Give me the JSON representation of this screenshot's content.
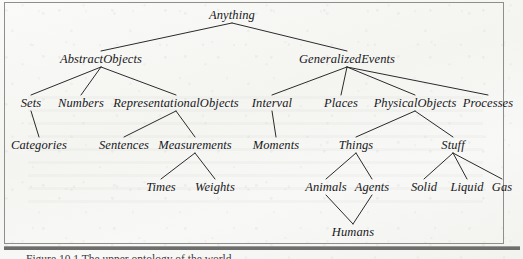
{
  "figure": {
    "caption": "Figure 10.1   The upper ontology of the world.",
    "frame_color": "#8e8e8b",
    "line_color": "#2a2a2c",
    "text_color": "#17171a",
    "paper_color": "#f7f7f5"
  },
  "diagram": {
    "type": "tree",
    "title": "The upper ontology of the world",
    "root": "Anything",
    "nodes": [
      {
        "id": "anything",
        "label": "Anything",
        "level": 1,
        "x": 232,
        "y": 9
      },
      {
        "id": "abstract-objects",
        "label": "AbstractObjects",
        "level": 2,
        "x": 101,
        "y": 53
      },
      {
        "id": "generalized-events",
        "label": "GeneralizedEvents",
        "level": 2,
        "x": 347,
        "y": 53
      },
      {
        "id": "sets",
        "label": "Sets",
        "level": 3,
        "x": 31,
        "y": 97
      },
      {
        "id": "numbers",
        "label": "Numbers",
        "level": 3,
        "x": 81,
        "y": 97
      },
      {
        "id": "representational-objects",
        "label": "RepresentationalObjects",
        "level": 3,
        "x": 176,
        "y": 97
      },
      {
        "id": "interval",
        "label": "Interval",
        "level": 3,
        "x": 272,
        "y": 97
      },
      {
        "id": "places",
        "label": "Places",
        "level": 3,
        "x": 341,
        "y": 97
      },
      {
        "id": "physical-objects",
        "label": "PhysicalObjects",
        "level": 3,
        "x": 415,
        "y": 97
      },
      {
        "id": "processes",
        "label": "Processes",
        "level": 3,
        "x": 488,
        "y": 97
      },
      {
        "id": "categories",
        "label": "Categories",
        "level": 4,
        "x": 39,
        "y": 139
      },
      {
        "id": "sentences",
        "label": "Sentences",
        "level": 4,
        "x": 124,
        "y": 139
      },
      {
        "id": "measurements",
        "label": "Measurements",
        "level": 4,
        "x": 195,
        "y": 139
      },
      {
        "id": "moments",
        "label": "Moments",
        "level": 4,
        "x": 276,
        "y": 139
      },
      {
        "id": "things",
        "label": "Things",
        "level": 4,
        "x": 356,
        "y": 139
      },
      {
        "id": "stuff",
        "label": "Stuff",
        "level": 4,
        "x": 453,
        "y": 139
      },
      {
        "id": "times",
        "label": "Times",
        "level": 5,
        "x": 161,
        "y": 181
      },
      {
        "id": "weights",
        "label": "Weights",
        "level": 5,
        "x": 215,
        "y": 181
      },
      {
        "id": "animals",
        "label": "Animals",
        "level": 5,
        "x": 326,
        "y": 181
      },
      {
        "id": "agents",
        "label": "Agents",
        "level": 5,
        "x": 372,
        "y": 181
      },
      {
        "id": "solid",
        "label": "Solid",
        "level": 5,
        "x": 424,
        "y": 181
      },
      {
        "id": "liquid",
        "label": "Liquid",
        "level": 5,
        "x": 467,
        "y": 181
      },
      {
        "id": "gas",
        "label": "Gas",
        "level": 5,
        "x": 502,
        "y": 181
      },
      {
        "id": "humans",
        "label": "Humans",
        "level": 6,
        "x": 353,
        "y": 226
      }
    ],
    "edges": [
      {
        "from": "anything",
        "to": "abstract-objects"
      },
      {
        "from": "anything",
        "to": "generalized-events"
      },
      {
        "from": "abstract-objects",
        "to": "sets"
      },
      {
        "from": "abstract-objects",
        "to": "numbers"
      },
      {
        "from": "abstract-objects",
        "to": "representational-objects"
      },
      {
        "from": "generalized-events",
        "to": "interval"
      },
      {
        "from": "generalized-events",
        "to": "places"
      },
      {
        "from": "generalized-events",
        "to": "physical-objects"
      },
      {
        "from": "generalized-events",
        "to": "processes"
      },
      {
        "from": "sets",
        "to": "categories"
      },
      {
        "from": "representational-objects",
        "to": "sentences"
      },
      {
        "from": "representational-objects",
        "to": "measurements"
      },
      {
        "from": "interval",
        "to": "moments"
      },
      {
        "from": "physical-objects",
        "to": "things"
      },
      {
        "from": "physical-objects",
        "to": "stuff"
      },
      {
        "from": "measurements",
        "to": "times"
      },
      {
        "from": "measurements",
        "to": "weights"
      },
      {
        "from": "things",
        "to": "animals"
      },
      {
        "from": "things",
        "to": "agents"
      },
      {
        "from": "stuff",
        "to": "solid"
      },
      {
        "from": "stuff",
        "to": "liquid"
      },
      {
        "from": "stuff",
        "to": "gas"
      },
      {
        "from": "animals",
        "to": "humans"
      },
      {
        "from": "agents",
        "to": "humans"
      }
    ]
  }
}
